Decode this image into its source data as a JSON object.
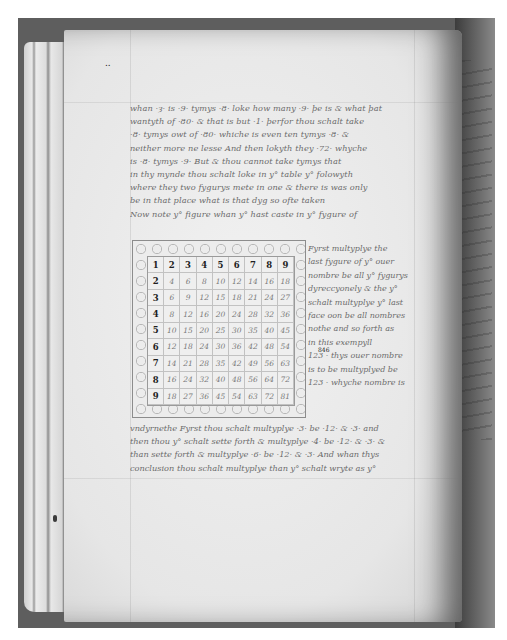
{
  "image": {
    "subject": "photograph of an open manuscript book page with handwritten text and a decorated 9x9 multiplication table",
    "colors": {
      "background": "#ffffff",
      "surround": "#5e5e5e",
      "parchment": "#ebebeb",
      "ink_faded": "#6b6b6b",
      "ink_dark": "#1f1f1f"
    }
  },
  "page": {
    "top_mark": "..",
    "text_lines": [
      "whan ·ȝ· is ·9· tymys ·8· loke how many ·9· þe is & what þat",
      "wantyth of ·80· & that is but ·1· þerfor thou schalt take",
      "·8· tymys owt of ·80· whiche is even ten tymys ·8· &",
      "neither more ne lesse And then lokyth they ·72· whyche",
      "is ·8· tymys ·9· But & thou cannot take tymys that",
      "in thy mynde thou schalt loke in y° table y° folowyth",
      "where they two fygurys mete in one & there is was only",
      "be in that place what is that dyg so ofte taken",
      "Now note y° figure whan y° hast caste in y° fygure of"
    ],
    "side_text_lines": [
      "Fyrst multyplye the",
      "last fygure of y° ouer",
      "nombre be all y° fygurys",
      "dyreccyonely & the y°",
      "schalt multyplye y° last",
      "face oon be all nombres",
      "nothe and so forth as",
      "in this exempyll",
      "123 · thys ouer nombre",
      "is to be multyplyed be",
      "123 · whyche nombre is"
    ],
    "side_numbers": {
      "a": "123",
      "a_superscript": "846",
      "b": "123"
    },
    "bottom_text_lines": [
      "vndyrnethe Fyrst thou schalt multyplye ·3· be ·12· & ·3· and",
      "then thou y° schalt sette forth & multyplye ·4· be ·12· & ·3· &",
      "than sette forth & multyplye ·6· be ·12· & ·3· And whan thys",
      "conclusion thou schalt multyplye than y° schalt wryte as y°"
    ]
  },
  "table": {
    "title": "multiplication table 1-9 (period numerals)",
    "rows": [
      [
        "1",
        "2",
        "3",
        "4",
        "5",
        "6",
        "7",
        "8",
        "9"
      ],
      [
        "2",
        "4",
        "6",
        "8",
        "10",
        "12",
        "14",
        "16",
        "18"
      ],
      [
        "3",
        "6",
        "9",
        "12",
        "15",
        "18",
        "21",
        "24",
        "27"
      ],
      [
        "4",
        "8",
        "12",
        "16",
        "20",
        "24",
        "28",
        "32",
        "36"
      ],
      [
        "5",
        "10",
        "15",
        "20",
        "25",
        "30",
        "35",
        "40",
        "45"
      ],
      [
        "6",
        "12",
        "18",
        "24",
        "30",
        "36",
        "42",
        "48",
        "54"
      ],
      [
        "7",
        "14",
        "21",
        "28",
        "35",
        "42",
        "49",
        "56",
        "63"
      ],
      [
        "8",
        "16",
        "24",
        "32",
        "40",
        "48",
        "56",
        "64",
        "72"
      ],
      [
        "9",
        "18",
        "27",
        "36",
        "45",
        "54",
        "63",
        "72",
        "81"
      ]
    ],
    "glyph_forms_row1": [
      "1",
      "2",
      "ȝ",
      "ꝶ",
      "ɥ",
      "6",
      "Λ",
      "8",
      "9"
    ]
  }
}
